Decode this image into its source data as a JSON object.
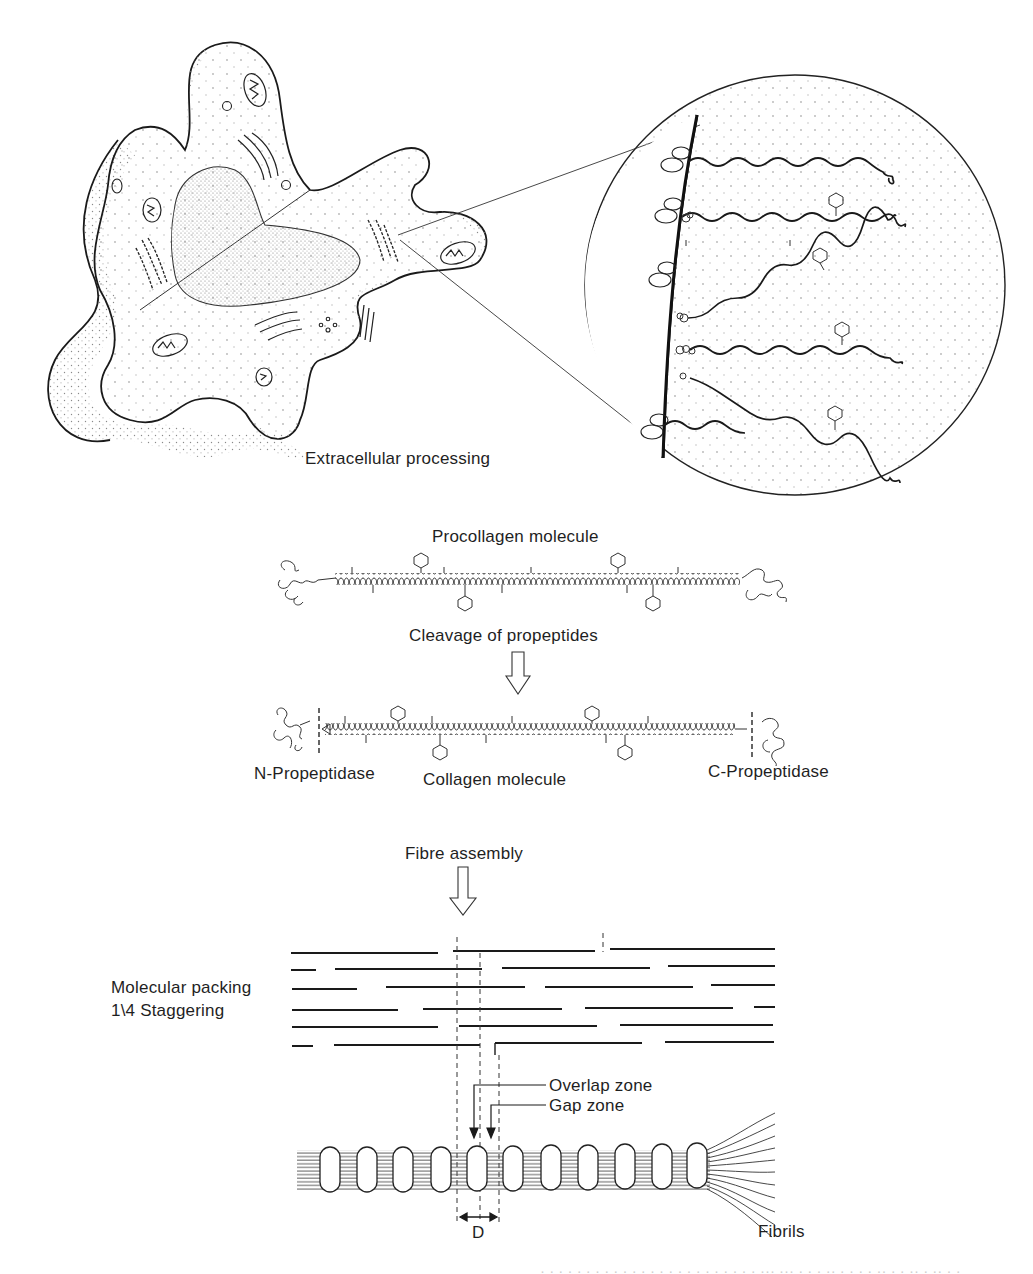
{
  "figure": {
    "stroke_color": "#1a1a1a",
    "stipple_color": "#9a9a9a",
    "background": "#ffffff"
  },
  "panels": {
    "cell": {
      "label": "Extracellular processing",
      "organelles": [
        "nucleus",
        "mitochondrion",
        "mitochondrion",
        "mitochondrion",
        "mitochondrion",
        "mitochondrion",
        "golgi-apparatus",
        "golgi-apparatus",
        "rough-endoplasmic-reticulum",
        "rough-endoplasmic-reticulum",
        "centriole",
        "vesicle"
      ]
    },
    "magnified_inset": {
      "shape": "circle",
      "chains": 6,
      "content": "procollagen chains secreted across the plasma membrane"
    },
    "procollagen": {
      "title": "Procollagen molecule",
      "step_label": "Cleavage of propeptides"
    },
    "collagen": {
      "left_label": "N-Propeptidase",
      "center_label": "Collagen molecule",
      "right_label": "C-Propeptidase"
    },
    "fibre": {
      "step_label": "Fibre assembly",
      "packing_label_line1": "Molecular packing",
      "packing_label_line2": "1\\4 Staggering",
      "overlap_label": "Overlap zone",
      "gap_label": "Gap zone",
      "period_label": "D",
      "fibrils_label": "Fibrils",
      "packing_rows": 6,
      "fibril_bands": 11
    }
  },
  "cut_off_text": "· · · · · · · · · · · · · · · · · · · · · · · ·  ··· ··· · · ·  ·· · · · ·  ·· · · ·· · ·· · ·"
}
